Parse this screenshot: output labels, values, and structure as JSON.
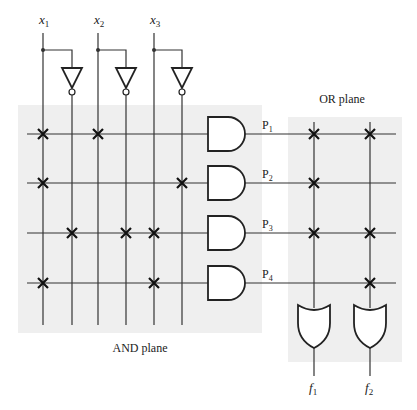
{
  "colors": {
    "plane_bg": "#efefef",
    "line": "#333333",
    "cross": "#111111"
  },
  "inputs": [
    {
      "name": "x",
      "sub": "1",
      "x": 43,
      "comp_x": 72
    },
    {
      "name": "x",
      "sub": "2",
      "x": 98,
      "comp_x": 126
    },
    {
      "name": "x",
      "sub": "3",
      "x": 154,
      "comp_x": 182
    }
  ],
  "and_plane": {
    "label": "AND plane",
    "rect": {
      "x": 18,
      "y": 105,
      "w": 244,
      "h": 228
    }
  },
  "or_plane": {
    "label": "OR plane",
    "rect": {
      "x": 288,
      "y": 117,
      "w": 114,
      "h": 245
    }
  },
  "products": [
    {
      "name": "P",
      "sub": "1",
      "y": 134,
      "and_cross": [
        43,
        98
      ],
      "or_cross": [
        314,
        370
      ]
    },
    {
      "name": "P",
      "sub": "2",
      "y": 183,
      "and_cross": [
        43,
        182
      ],
      "or_cross": [
        314
      ]
    },
    {
      "name": "P",
      "sub": "3",
      "y": 233,
      "and_cross": [
        72,
        126,
        154
      ],
      "or_cross": [
        314,
        370
      ]
    },
    {
      "name": "P",
      "sub": "4",
      "y": 283,
      "and_cross": [
        43,
        154
      ],
      "or_cross": [
        370
      ]
    }
  ],
  "outputs": [
    {
      "name": "f",
      "sub": "1",
      "x": 314
    },
    {
      "name": "f",
      "sub": "2",
      "x": 370
    }
  ]
}
